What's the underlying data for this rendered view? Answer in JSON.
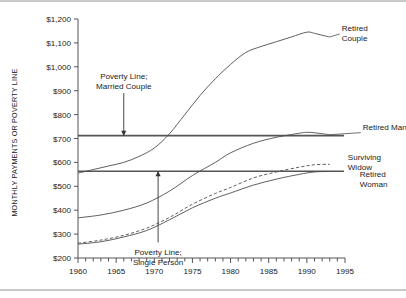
{
  "chart_data": {
    "type": "line",
    "title": "",
    "subtitle": "",
    "xlabel": "",
    "ylabel": "MONTHLY PAYMENTS OR POVERTY LINE",
    "xlim": [
      1960,
      1995
    ],
    "ylim": [
      200,
      1200
    ],
    "grid": false,
    "legend_position": "right-of-line-ends",
    "x_tick_labels": [
      "1960",
      "1965",
      "1970",
      "1975",
      "1980",
      "1985",
      "1990",
      "1995"
    ],
    "x_tick_values": [
      1960,
      1965,
      1970,
      1975,
      1980,
      1985,
      1990,
      1995
    ],
    "x_minor_tick_interval": 1,
    "y_tick_labels": [
      "$200",
      "$300",
      "$400",
      "$500",
      "$600",
      "$700",
      "$800",
      "$900",
      "$1,000",
      "$1,100",
      "$1,200"
    ],
    "y_tick_values": [
      200,
      300,
      400,
      500,
      600,
      700,
      800,
      900,
      1000,
      1100,
      1200
    ],
    "series": [
      {
        "name": "Retired Couple",
        "style": "solid",
        "label": "Retired\nCouple",
        "label_lines": [
          "Retired",
          "Couple"
        ],
        "x": [
          1960,
          1962,
          1964,
          1966,
          1968,
          1970,
          1972,
          1974,
          1976,
          1978,
          1980,
          1982,
          1984,
          1986,
          1988,
          1990,
          1991,
          1992,
          1993
        ],
        "y": [
          555,
          570,
          585,
          600,
          625,
          660,
          720,
          800,
          880,
          950,
          1010,
          1060,
          1085,
          1105,
          1125,
          1145,
          1140,
          1132,
          1125
        ]
      },
      {
        "name": "Retired Man",
        "style": "solid",
        "label": "Retired Man",
        "label_lines": [
          "Retired Man"
        ],
        "x": [
          1960,
          1963,
          1966,
          1969,
          1972,
          1975,
          1978,
          1980,
          1983,
          1986,
          1989,
          1990,
          1991,
          1992,
          1993
        ],
        "y": [
          368,
          380,
          400,
          430,
          480,
          545,
          600,
          640,
          680,
          705,
          722,
          726,
          724,
          720,
          716
        ]
      },
      {
        "name": "Surviving Widow",
        "style": "dashed",
        "label": "Surviving\nWidow",
        "label_lines": [
          "Surviving",
          "Widow"
        ],
        "x": [
          1960,
          1963,
          1966,
          1969,
          1972,
          1975,
          1978,
          1980,
          1983,
          1986,
          1989,
          1991,
          1993
        ],
        "y": [
          262,
          275,
          295,
          325,
          370,
          425,
          470,
          495,
          535,
          560,
          580,
          590,
          592
        ]
      },
      {
        "name": "Retired Woman",
        "style": "solid",
        "label": "Retired\nWoman",
        "label_lines": [
          "Retired",
          "Woman"
        ],
        "x": [
          1960,
          1963,
          1966,
          1969,
          1972,
          1975,
          1978,
          1980,
          1983,
          1986,
          1989,
          1991,
          1993
        ],
        "y": [
          258,
          268,
          288,
          315,
          360,
          410,
          450,
          472,
          505,
          530,
          550,
          560,
          562
        ]
      }
    ],
    "reference_lines": [
      {
        "name": "Poverty Line; Married Couple",
        "value": 712,
        "orientation": "horizontal",
        "annotation_lines": [
          "Poverty Line;",
          "Married Couple"
        ]
      },
      {
        "name": "Poverty Line; Single Person",
        "value": 563,
        "orientation": "horizontal",
        "annotation_lines": [
          "Poverty Line;",
          "Single Person"
        ]
      }
    ],
    "annotations": [
      {
        "name": "married-couple-annotation",
        "lines": [
          "Poverty Line;",
          "Married Couple"
        ],
        "arrow_from_year": 1966,
        "arrow_from_value": 890,
        "arrow_to_year": 1966,
        "arrow_to_value": 712
      },
      {
        "name": "single-person-annotation",
        "lines": [
          "Poverty Line;",
          "Single Person"
        ],
        "arrow_from_year": 1970.5,
        "arrow_from_value": 265,
        "arrow_to_year": 1970.5,
        "arrow_to_value": 563
      }
    ],
    "colors": {
      "line": "#4d4d4d",
      "reference_line": "#555555",
      "axis": "#555555",
      "text": "#1a1a1a",
      "background": "#ffffff"
    }
  }
}
